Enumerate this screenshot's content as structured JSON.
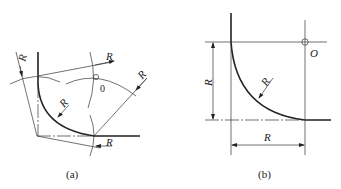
{
  "figure_a": {
    "caption": "(a)",
    "center_label": "0",
    "radius_labels": [
      "R",
      "R",
      "R",
      "R",
      "R"
    ]
  },
  "figure_b": {
    "caption": "(b)",
    "center_label": "O",
    "radius_label": "R",
    "vertical_dim_label": "R",
    "horizontal_dim_label": "R"
  }
}
